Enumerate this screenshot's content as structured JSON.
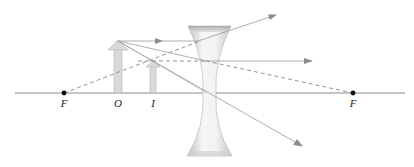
{
  "diagram": {
    "colors": {
      "axis": "#8a8a8a",
      "ray": "#9a9a9a",
      "dashed_ray": "#7a7a7a",
      "arrowhead": "#8c8c8c",
      "object_fill": "#d9d9d9",
      "object_stroke": "#b5b5b5",
      "focal_point": "#111111",
      "lens_light": "#f4f4f4",
      "lens_dark": "#bdbdbd",
      "label": "#222222"
    },
    "labels": {
      "focal_left": "F",
      "object": "O",
      "image": "I",
      "focal_right": "F"
    },
    "elements": {
      "optical_axis": {
        "x1": 15,
        "x2": 405,
        "y": 93
      },
      "focal_point_left": {
        "x": 64,
        "y": 93
      },
      "focal_point_right": {
        "x": 353,
        "y": 93
      },
      "object_arrow": {
        "x": 118,
        "base_y": 93,
        "tip_y": 41
      },
      "image_arrow": {
        "x": 153,
        "base_y": 93,
        "tip_y": 60
      },
      "lens": {
        "type": "concave",
        "center_x": 209,
        "top_y": 25,
        "bottom_y": 157
      }
    }
  }
}
